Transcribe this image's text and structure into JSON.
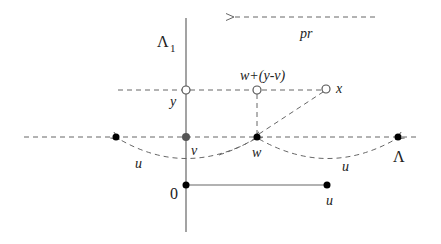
{
  "diagram": {
    "labels": {
      "lambda1": "Λ",
      "lambda1_sub": "1",
      "pr": "pr",
      "y": "y",
      "w_plus": "w+(y-v)",
      "x": "x",
      "v": "v",
      "w": "w",
      "u_left": "u",
      "u_right": "u",
      "lambda": "Λ",
      "zero": "0",
      "u_bottom": "u"
    },
    "colors": {
      "line": "#666666",
      "point": "#000000",
      "point_v": "#555555",
      "text": "#222222"
    }
  }
}
